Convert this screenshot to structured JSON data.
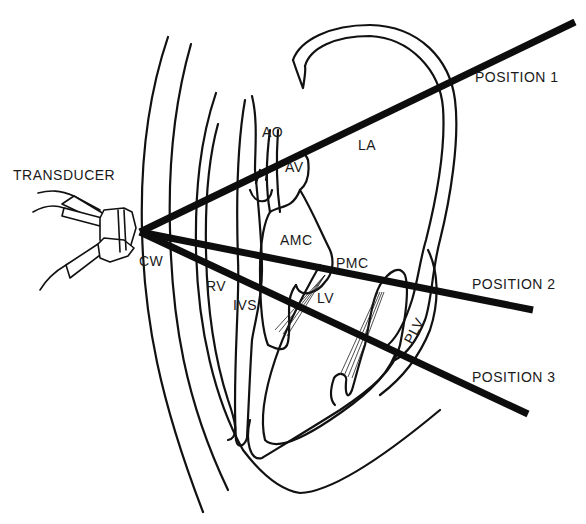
{
  "figure": {
    "type": "echocardiography beam position diagram",
    "labels": {
      "transducer": "TRANSDUCER",
      "chest_wall": "CW",
      "aorta": "AO",
      "aortic_valve": "AV",
      "left_atrium": "LA",
      "anterior_mitral_cusp": "AMC",
      "posterior_mitral_cusp": "PMC",
      "right_ventricle": "RV",
      "interventricular_septum": "IVS",
      "left_ventricle": "LV",
      "posterior_left_ventricle": "PLV"
    },
    "positions": [
      {
        "label": "POSITION 1"
      },
      {
        "label": "POSITION 2"
      },
      {
        "label": "POSITION 3"
      }
    ],
    "colors": {
      "ink": "#111111",
      "background": "#ffffff"
    }
  }
}
